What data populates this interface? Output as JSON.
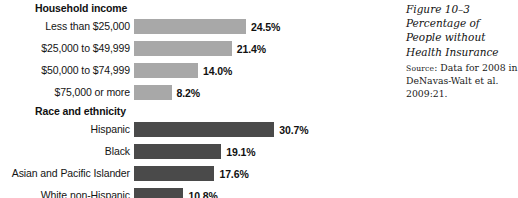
{
  "figure": {
    "caption": {
      "figure_number": "Figure 10–3",
      "title": "Percentage of People without Health Insurance",
      "source_label": "Source",
      "source_text": ": Data for 2008 in DeNavas-Walt et al. 2009:21."
    }
  },
  "colors": {
    "bar_light": "#a8a8a8",
    "bar_dark": "#4a4a4a",
    "background": "#ffffff",
    "text": "#111111"
  },
  "chart_data": [
    {
      "type": "bar",
      "orientation": "horizontal",
      "title": "Household income",
      "xlabel": "",
      "ylabel": "",
      "xlim": [
        0,
        32
      ],
      "grid": false,
      "legend": "none",
      "bar_color": "#a8a8a8",
      "value_suffix": "%",
      "categories": [
        "Less than $25,000",
        "$25,000 to $49,999",
        "$50,000 to $74,999",
        "$75,000 or more"
      ],
      "values": [
        24.5,
        21.4,
        14.0,
        8.2
      ],
      "value_labels": [
        "24.5%",
        "21.4%",
        "14.0%",
        "8.2%"
      ]
    },
    {
      "type": "bar",
      "orientation": "horizontal",
      "title": "Race and ethnicity",
      "xlabel": "",
      "ylabel": "",
      "xlim": [
        0,
        32
      ],
      "grid": false,
      "legend": "none",
      "bar_color": "#4a4a4a",
      "value_suffix": "%",
      "categories": [
        "Hispanic",
        "Black",
        "Asian and Pacific Islander",
        "White non-Hispanic"
      ],
      "values": [
        30.7,
        19.1,
        17.6,
        10.8
      ],
      "value_labels": [
        "30.7%",
        "19.1%",
        "17.6%",
        "10.8%"
      ]
    }
  ]
}
